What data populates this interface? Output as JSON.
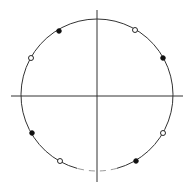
{
  "diagram": {
    "type": "points-on-circle",
    "center": [
      97,
      95
    ],
    "radius": 76,
    "colors": {
      "line": "#333333",
      "faint_line": "#9a9a9a",
      "filled_point": "#111111",
      "open_point_fill": "#ffffff",
      "background": "#ffffff"
    },
    "axes": {
      "horizontal": {
        "x1": 11,
        "x2": 183,
        "y": 96
      },
      "vertical": {
        "x": 97,
        "y1": 10,
        "y2": 182
      }
    },
    "arc_gap": {
      "start_deg": 255,
      "end_deg": 285,
      "style": "faint"
    },
    "points": [
      {
        "x": 59,
        "y": 31,
        "style": "filled"
      },
      {
        "x": 31,
        "y": 58,
        "style": "open"
      },
      {
        "x": 135,
        "y": 30,
        "style": "open"
      },
      {
        "x": 163,
        "y": 58,
        "style": "filled"
      },
      {
        "x": 32,
        "y": 133,
        "style": "filled"
      },
      {
        "x": 60,
        "y": 161,
        "style": "open"
      },
      {
        "x": 163,
        "y": 133,
        "style": "open"
      },
      {
        "x": 136,
        "y": 161,
        "style": "filled"
      }
    ]
  }
}
